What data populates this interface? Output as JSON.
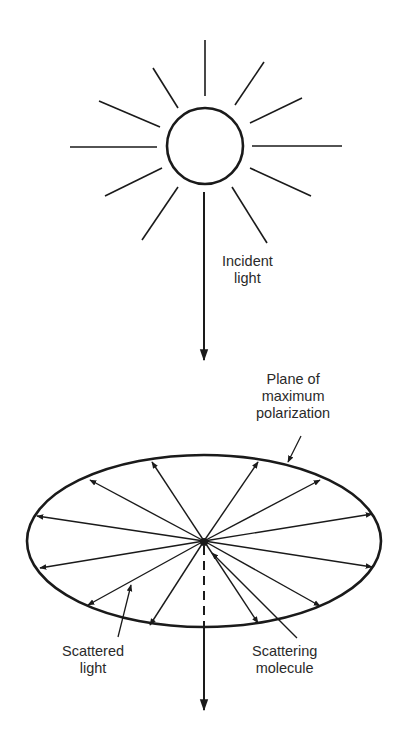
{
  "diagram": {
    "stroke_color": "#1a1a1a",
    "background": "#ffffff",
    "labels": {
      "incident_light": [
        "Incident",
        "light"
      ],
      "plane_of_polarization": [
        "Plane of",
        "maximum",
        "polarization"
      ],
      "scattered_light": [
        "Scattered",
        "light"
      ],
      "scattering_molecule": [
        "Scattering",
        "molecule"
      ]
    },
    "sun": {
      "center": [
        205,
        146
      ],
      "radius": 38,
      "rays": [
        [
          205,
          40,
          205,
          96
        ],
        [
          264,
          62,
          235,
          105
        ],
        [
          302,
          98,
          250,
          123
        ],
        [
          342,
          146,
          252,
          146
        ],
        [
          311,
          196,
          250,
          168
        ],
        [
          267,
          243,
          232,
          187
        ],
        [
          142,
          240,
          178,
          187
        ],
        [
          105,
          196,
          162,
          168
        ],
        [
          70,
          147,
          157,
          147
        ],
        [
          99,
          101,
          160,
          127
        ],
        [
          153,
          68,
          178,
          108
        ]
      ]
    },
    "incident_beam": {
      "x": 204,
      "y_start": 192,
      "y_arrow": 360
    },
    "ellipse": {
      "cx": 204,
      "cy": 541,
      "rx": 177,
      "ry": 86
    },
    "scattered_arrows": [
      [
        152,
        462
      ],
      [
        90,
        480
      ],
      [
        37,
        516
      ],
      [
        40,
        568
      ],
      [
        88,
        605
      ],
      [
        150,
        625
      ],
      [
        258,
        462
      ],
      [
        320,
        480
      ],
      [
        372,
        514
      ],
      [
        372,
        567
      ],
      [
        320,
        606
      ],
      [
        258,
        623
      ]
    ],
    "transmitted_beam": {
      "x": 204,
      "dash_from": 546,
      "dash_to": 627,
      "y_arrow": 710
    }
  }
}
